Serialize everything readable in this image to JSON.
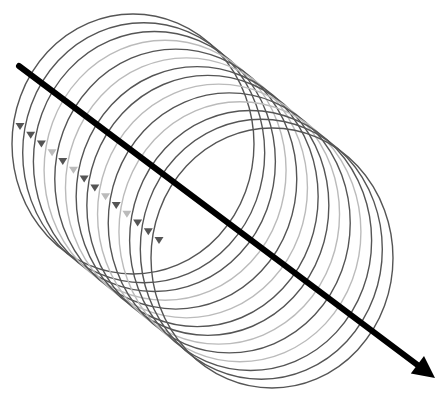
{
  "diagram": {
    "title": "Magnetic field loops around a current-carrying wire",
    "wire": {
      "x1": 19,
      "y1": 66,
      "x2": 435,
      "y2": 378,
      "color": "#000000",
      "width": 6
    },
    "loops": {
      "count": 14,
      "start_center": [
        133,
        144
      ],
      "end_center": [
        272,
        258
      ],
      "rx": 121,
      "ry": 130,
      "dark_color": "#555555",
      "light_color": "#bbbbbb",
      "pattern": [
        "dark",
        "dark",
        "dark",
        "light",
        "dark",
        "light",
        "dark",
        "dark",
        "light",
        "dark",
        "light",
        "dark",
        "dark",
        "dark"
      ],
      "arrow_direction": "down",
      "arrow_color": "#555555"
    }
  }
}
